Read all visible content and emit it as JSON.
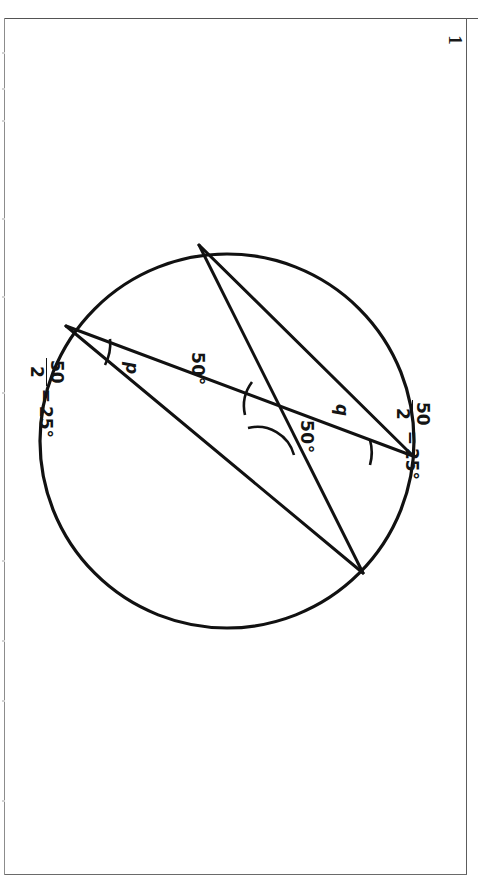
{
  "page": {
    "number": "1",
    "background_color": "#ffffff",
    "ink_color": "#111111",
    "border_color": "#5c5c5c"
  },
  "diagram": {
    "shape": "circle",
    "circle": {
      "center_x": 227,
      "center_y": 441,
      "radius": 187,
      "stroke_width": 3.2
    },
    "vertices": [
      {
        "id": "A",
        "name": "top-vertex",
        "x": 199,
        "y": 245
      },
      {
        "id": "B",
        "name": "left-vertex",
        "x": 66,
        "y": 326
      },
      {
        "id": "C",
        "name": "right-vertex",
        "x": 413,
        "y": 456
      },
      {
        "id": "D",
        "name": "bottom-vertex",
        "x": 363,
        "y": 573
      }
    ],
    "chords": [
      {
        "id": "AC",
        "name": "chord-top-to-right",
        "from": "A",
        "to": "C"
      },
      {
        "id": "AD",
        "name": "chord-top-to-bottom",
        "from": "A",
        "to": "D"
      },
      {
        "id": "BC",
        "name": "chord-left-to-right",
        "from": "B",
        "to": "C"
      },
      {
        "id": "BD",
        "name": "chord-left-to-bottom",
        "from": "B",
        "to": "D"
      }
    ],
    "intersection": {
      "name": "chord-intersection",
      "x": 282,
      "y": 420
    }
  },
  "labels": {
    "angle_p": "p",
    "angle_q": "q",
    "angle_50_upper": "50°",
    "angle_50_lower": "50°"
  },
  "working": {
    "left_note": {
      "numerator": "50",
      "denominator": "2",
      "equals": "=",
      "result": "25°"
    },
    "right_note": {
      "numerator": "50",
      "denominator": "2",
      "equals": "=",
      "result": "25°"
    }
  }
}
